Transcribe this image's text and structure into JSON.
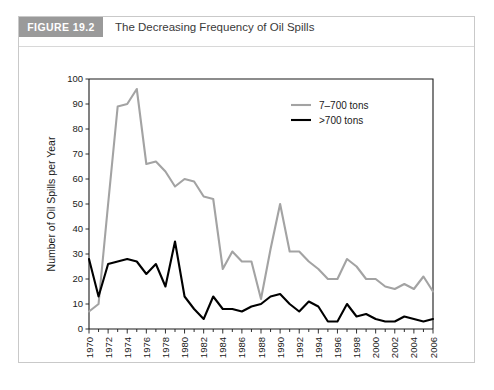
{
  "figure": {
    "badge": "FIGURE 19.2",
    "title": "The Decreasing Frequency of Oil Spills"
  },
  "chart_data": {
    "type": "line",
    "title": "The Decreasing Frequency of Oil Spills",
    "xlabel": "Year",
    "ylabel": "Number of Oil Spills per Year",
    "xlim": [
      1970,
      2006
    ],
    "ylim": [
      0,
      100
    ],
    "ytick_labels": [
      "0",
      "10",
      "20",
      "30",
      "40",
      "50",
      "60",
      "70",
      "80",
      "90",
      "100"
    ],
    "yticks": [
      0,
      10,
      20,
      30,
      40,
      50,
      60,
      70,
      80,
      90,
      100
    ],
    "xtick_labels": [
      "1970",
      "1972",
      "1974",
      "1976",
      "1978",
      "1980",
      "1982",
      "1984",
      "1986",
      "1988",
      "1990",
      "1992",
      "1994",
      "1996",
      "1998",
      "2000",
      "2002",
      "2004",
      "2006"
    ],
    "xticks": [
      1970,
      1972,
      1974,
      1976,
      1978,
      1980,
      1982,
      1984,
      1986,
      1988,
      1990,
      1992,
      1994,
      1996,
      1998,
      2000,
      2002,
      2004,
      2006
    ],
    "xticks_minor": [
      1971,
      1973,
      1975,
      1977,
      1979,
      1981,
      1983,
      1985,
      1987,
      1989,
      1991,
      1993,
      1995,
      1997,
      1999,
      2001,
      2003,
      2005
    ],
    "grid": false,
    "legend_position": "upper-right",
    "x": [
      1970,
      1971,
      1972,
      1973,
      1974,
      1975,
      1976,
      1977,
      1978,
      1979,
      1980,
      1981,
      1982,
      1983,
      1984,
      1985,
      1986,
      1987,
      1988,
      1989,
      1990,
      1991,
      1992,
      1993,
      1994,
      1995,
      1996,
      1997,
      1998,
      1999,
      2000,
      2001,
      2002,
      2003,
      2004,
      2005,
      2006
    ],
    "series": [
      {
        "name": "7–700 tons",
        "color": "#a3a3a3",
        "values": [
          7,
          10,
          50,
          89,
          90,
          96,
          66,
          67,
          63,
          57,
          60,
          59,
          53,
          52,
          24,
          31,
          27,
          27,
          12,
          32,
          50,
          31,
          31,
          27,
          24,
          20,
          20,
          28,
          25,
          20,
          20,
          17,
          16,
          18,
          16,
          21,
          15
        ]
      },
      {
        "name": ">700 tons",
        "color": "#000000",
        "values": [
          28,
          13,
          26,
          27,
          28,
          27,
          22,
          26,
          17,
          35,
          13,
          8,
          4,
          13,
          8,
          8,
          7,
          9,
          10,
          13,
          14,
          10,
          7,
          11,
          9,
          3,
          3,
          10,
          5,
          6,
          4,
          3,
          3,
          5,
          4,
          3,
          4
        ]
      }
    ]
  }
}
